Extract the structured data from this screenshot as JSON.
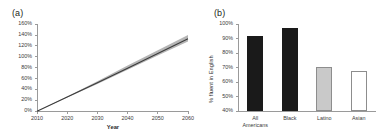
{
  "figure": {
    "panel_a_label": "(a)",
    "panel_b_label": "(b)"
  },
  "chart_data": [
    {
      "id": "panel-a",
      "type": "line",
      "panel": "(a)",
      "title": "",
      "xlabel": "Year",
      "ylabel": "",
      "xlim": [
        2010,
        2060
      ],
      "ylim": [
        0,
        160
      ],
      "grid": false,
      "legend": false,
      "y_tick_labels": [
        "0%",
        "20%",
        "40%",
        "60%",
        "80%",
        "100%",
        "120%",
        "140%",
        "160%"
      ],
      "y_ticks": [
        0,
        20,
        40,
        60,
        80,
        100,
        120,
        140,
        160
      ],
      "x_tick_labels": [
        "2010",
        "2020",
        "2030",
        "2040",
        "2050",
        "2060"
      ],
      "x_ticks": [
        2010,
        2020,
        2030,
        2040,
        2050,
        2060
      ],
      "series": [
        {
          "name": "Projected growth",
          "color": "#3b3b3b",
          "x": [
            2010,
            2020,
            2030,
            2040,
            2050,
            2060
          ],
          "values": [
            0,
            26,
            52,
            79,
            106,
            133
          ]
        }
      ],
      "band": {
        "name": "Uncertainty band",
        "color": "#b5b5b5",
        "x": [
          2010,
          2020,
          2030,
          2040,
          2050,
          2060
        ],
        "upper": [
          0,
          27,
          55,
          84,
          112,
          140
        ],
        "lower": [
          0,
          25,
          50,
          76,
          102,
          128
        ]
      }
    },
    {
      "id": "panel-b",
      "type": "bar",
      "panel": "(b)",
      "title": "",
      "xlabel": "",
      "ylabel": "% fluent in English",
      "ylim": [
        40,
        100
      ],
      "grid": false,
      "legend": false,
      "y_tick_labels": [
        "40%",
        "50%",
        "60%",
        "70%",
        "80%",
        "90%",
        "100%"
      ],
      "y_ticks": [
        40,
        50,
        60,
        70,
        80,
        90,
        100
      ],
      "categories": [
        "All\nAmericans",
        "Black",
        "Latino",
        "Asian"
      ],
      "values": [
        92,
        97.5,
        70.5,
        68
      ],
      "bar_styles": [
        "dark",
        "dark",
        "gray",
        "white"
      ],
      "colors": {
        "dark": "#1a1a1a",
        "gray": "#c9c9c9",
        "white": "#ffffff",
        "outline": "#8d8d8d",
        "axis": "#9a9a9a"
      }
    }
  ]
}
